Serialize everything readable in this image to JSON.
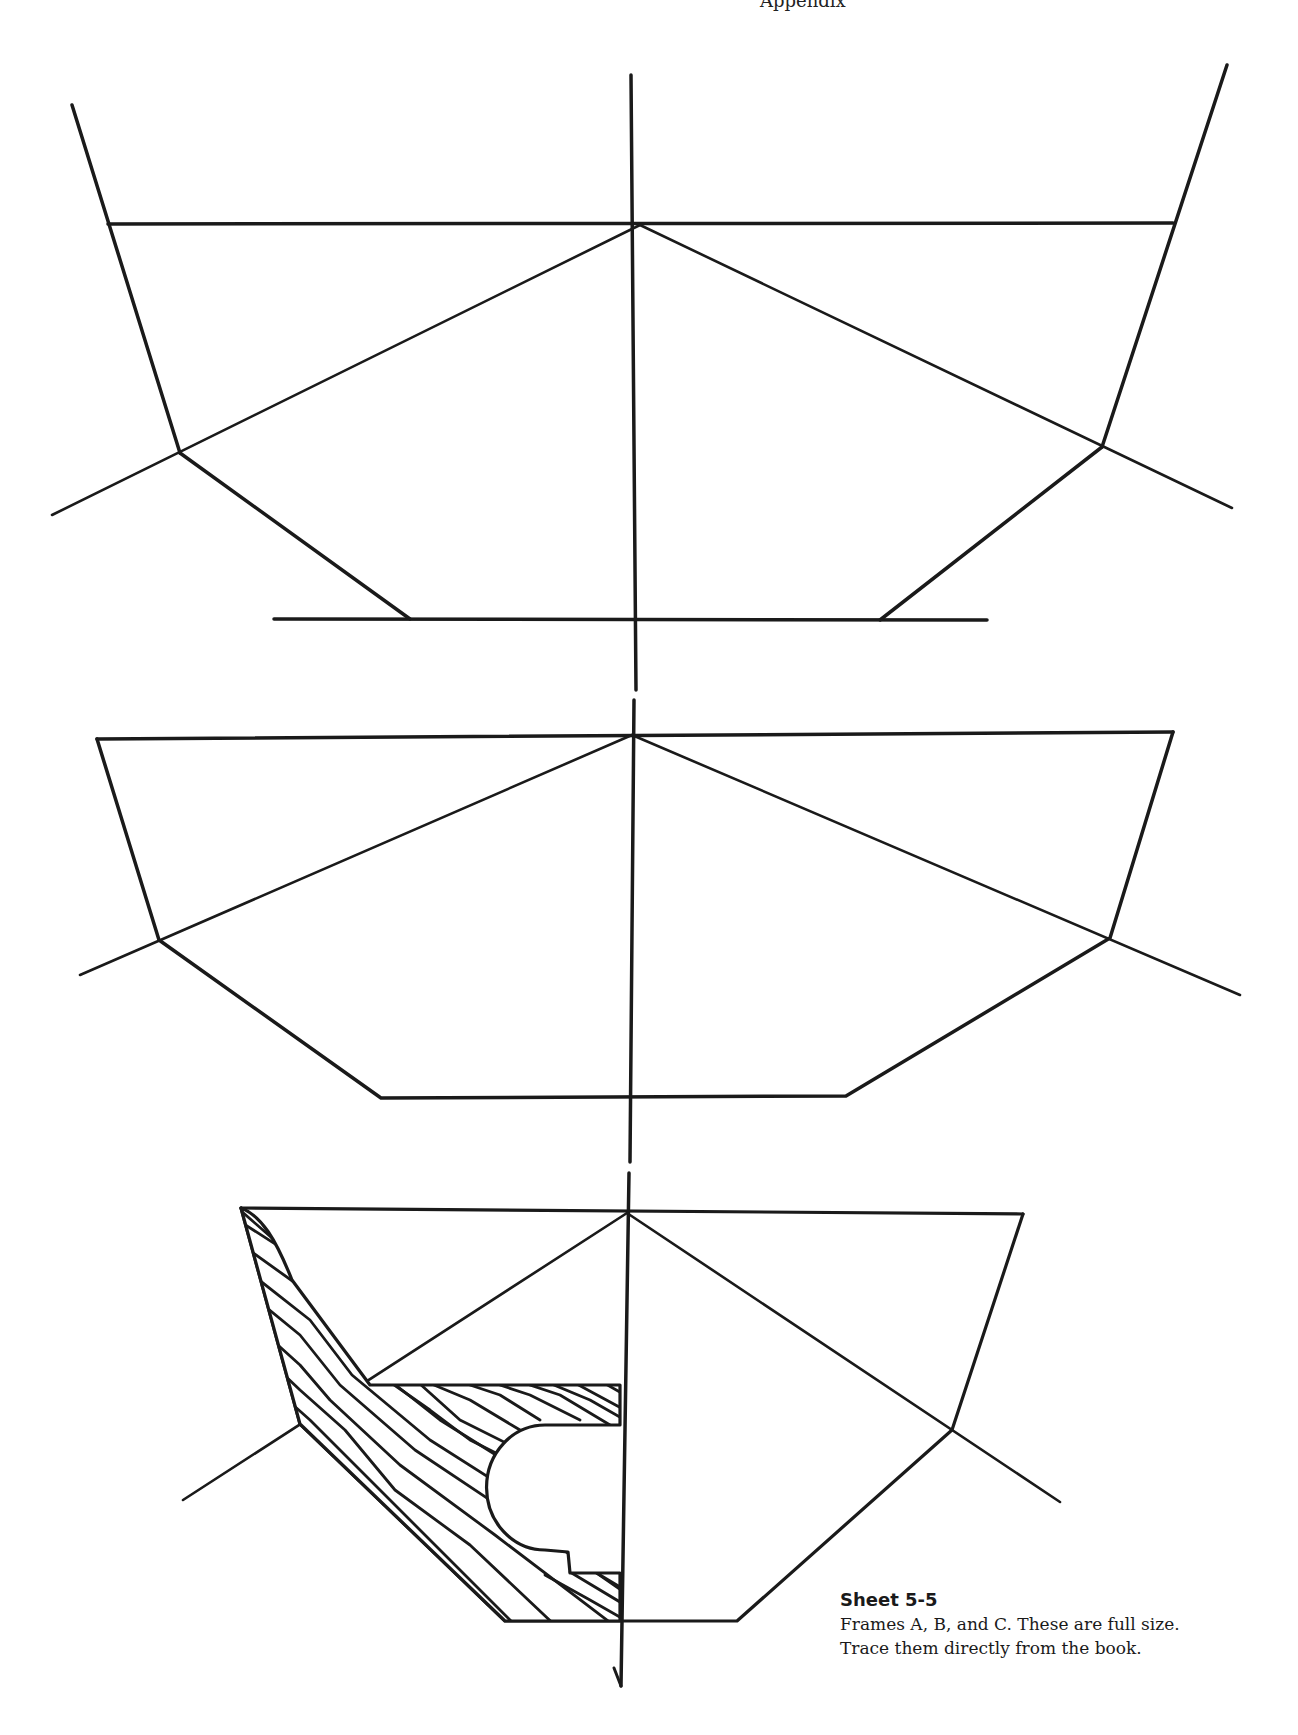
{
  "page": {
    "header_fragment": "Appendix",
    "ink_color": "#1a1a1a",
    "background": "#ffffff"
  },
  "caption": {
    "title": "Sheet 5-5",
    "line1": "Frames A, B, and C. These are full size.",
    "line2": "Trace them directly from the book."
  },
  "frames": [
    {
      "name": "Frame A",
      "deck_line": [
        [
          108,
          224
        ],
        [
          1173,
          223
        ]
      ],
      "sheer_left": [
        [
          72,
          105
        ],
        [
          180,
          453
        ]
      ],
      "sheer_right": [
        [
          1227,
          65
        ],
        [
          1102,
          447
        ]
      ],
      "bottom_left": [
        [
          180,
          453
        ],
        [
          410,
          619
        ]
      ],
      "bottom_right": [
        [
          1102,
          447
        ],
        [
          880,
          620
        ]
      ],
      "keel_line": [
        [
          274,
          619
        ],
        [
          987,
          620
        ]
      ],
      "apex": [
        640,
        225
      ],
      "diagonal_left": [
        [
          640,
          225
        ],
        [
          52,
          515
        ]
      ],
      "diagonal_right": [
        [
          640,
          225
        ],
        [
          1232,
          508
        ]
      ]
    },
    {
      "name": "Frame B",
      "deck_line": [
        [
          97,
          739
        ],
        [
          1173,
          732
        ]
      ],
      "sides": [
        [
          97,
          739
        ],
        [
          159,
          940
        ],
        [
          381,
          1098
        ],
        [
          846,
          1096
        ],
        [
          1110,
          938
        ],
        [
          1173,
          732
        ]
      ],
      "apex": [
        632,
        735
      ],
      "diagonal_left": [
        [
          632,
          735
        ],
        [
          80,
          975
        ]
      ],
      "diagonal_right": [
        [
          632,
          735
        ],
        [
          1240,
          995
        ]
      ]
    },
    {
      "name": "Frame C",
      "deck_line": [
        [
          241,
          1208
        ],
        [
          1023,
          1214
        ]
      ],
      "sides": [
        [
          241,
          1208
        ],
        [
          300,
          1424
        ],
        [
          505,
          1621
        ],
        [
          737,
          1621
        ],
        [
          952,
          1430
        ],
        [
          1023,
          1214
        ]
      ],
      "apex": [
        627,
        1213
      ],
      "diagonal_left": [
        [
          627,
          1213
        ],
        [
          183,
          1500
        ]
      ],
      "diagonal_right": [
        [
          627,
          1213
        ],
        [
          1060,
          1502
        ]
      ],
      "hatched_part": "half-frame timber with shaft cutout"
    }
  ],
  "centerline": {
    "x": 630,
    "segments": [
      [
        75,
        690
      ],
      [
        700,
        1162
      ],
      [
        1173,
        1686
      ]
    ],
    "arrow_end": [
      619,
      1686
    ]
  }
}
